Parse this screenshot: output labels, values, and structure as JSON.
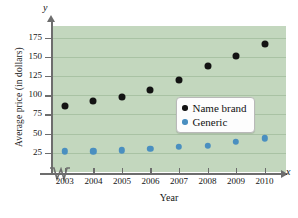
{
  "chart_data": {
    "type": "scatter",
    "title": "",
    "xlabel": "Year",
    "ylabel": "Average price (in dollars)",
    "x_axis_letter": "x",
    "y_axis_letter": "y",
    "categories": [
      "2003",
      "2004",
      "2005",
      "2006",
      "2007",
      "2008",
      "2009",
      "2010"
    ],
    "x": [
      2003,
      2004,
      2005,
      2006,
      2007,
      2008,
      2009,
      2010
    ],
    "series": [
      {
        "name": "Name brand",
        "color": "#131313",
        "values": [
          86,
          92,
          98,
          107,
          120,
          138,
          151,
          167
        ]
      },
      {
        "name": "Generic",
        "color": "#4a8fc0",
        "values": [
          27,
          27,
          28,
          30,
          33,
          34,
          39,
          44
        ]
      }
    ],
    "y_ticks": [
      25,
      50,
      75,
      100,
      125,
      150,
      175
    ],
    "ylim": [
      0,
      190
    ],
    "xlim": [
      2002.55,
      2010.75
    ],
    "grid": true,
    "grid_axis": "y",
    "legend_position": "center-right",
    "axis_break_x": true,
    "plot_background_color": "#c3d7be",
    "gridline_color": "#a9c2a4",
    "axis_color": "#6d6d6d"
  }
}
